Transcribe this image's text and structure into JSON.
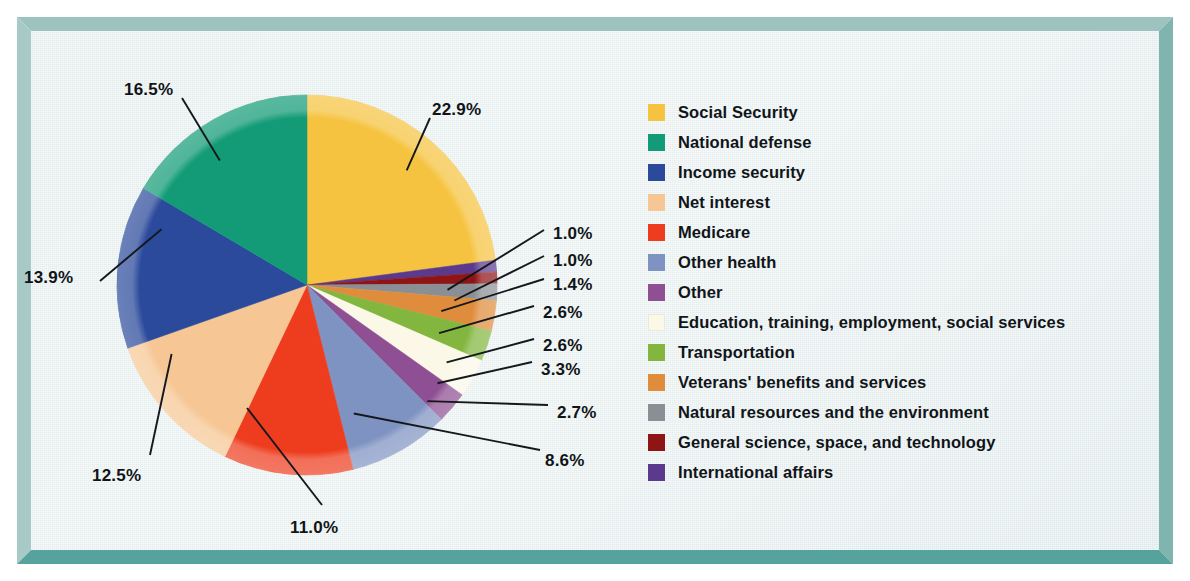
{
  "frame": {
    "border_color": "#7fb4af",
    "background_color": "#e9f1f1"
  },
  "chart_data": {
    "type": "pie",
    "title": "",
    "subtitle": "",
    "xlabel": "",
    "ylabel": "",
    "legend_position": "right",
    "grid": false,
    "units": "percent",
    "total": 100.0,
    "start_angle_deg": 0,
    "direction": "clockwise",
    "categories": [
      "Social Security",
      "International affairs",
      "General science, space, and technology",
      "Natural resources and the environment",
      "Veterans' benefits and services",
      "Transportation",
      "Education, training, employment, social services",
      "Other",
      "Other health",
      "Medicare",
      "Net interest",
      "Income security",
      "National defense"
    ],
    "values": [
      22.9,
      1.0,
      1.0,
      1.4,
      2.6,
      2.6,
      3.3,
      2.7,
      8.6,
      11.0,
      12.5,
      13.9,
      16.5
    ],
    "colors": [
      "#f5c council",
      "#5b3a8e",
      "#8f1414",
      "#8a8f96",
      "#df8c3c",
      "#82b63e",
      "#fbf8e8",
      "#8e4f93",
      "#7f93c2",
      "#ee3d1e",
      "#f6c794",
      "#2b4a9b",
      "#129b76"
    ],
    "slices": [
      {
        "label": "Social Security",
        "value": 22.9,
        "pct_text": "22.9%",
        "color": "#f5c33f"
      },
      {
        "label": "International affairs",
        "value": 1.0,
        "pct_text": "1.0%",
        "color": "#5b3a8e"
      },
      {
        "label": "General science, space, and technology",
        "value": 1.0,
        "pct_text": "1.0%",
        "color": "#8f1414"
      },
      {
        "label": "Natural resources and the environment",
        "value": 1.4,
        "pct_text": "1.4%",
        "color": "#8a8f96"
      },
      {
        "label": "Veterans' benefits and services",
        "value": 2.6,
        "pct_text": "2.6%",
        "color": "#df8c3c"
      },
      {
        "label": "Transportation",
        "value": 2.6,
        "pct_text": "2.6%",
        "color": "#82b63e"
      },
      {
        "label": "Education, training, employment, social services",
        "value": 3.3,
        "pct_text": "3.3%",
        "color": "#fbf8e8"
      },
      {
        "label": "Other",
        "value": 2.7,
        "pct_text": "2.7%",
        "color": "#8e4f93"
      },
      {
        "label": "Other health",
        "value": 8.6,
        "pct_text": "8.6%",
        "color": "#7f93c2"
      },
      {
        "label": "Medicare",
        "value": 11.0,
        "pct_text": "11.0%",
        "color": "#ee3d1e"
      },
      {
        "label": "Net interest",
        "value": 12.5,
        "pct_text": "12.5%",
        "color": "#f6c794"
      },
      {
        "label": "Income security",
        "value": 13.9,
        "pct_text": "13.9%",
        "color": "#2b4a9b"
      },
      {
        "label": "National defense",
        "value": 16.5,
        "pct_text": "16.5%",
        "color": "#129b76"
      }
    ]
  },
  "labels": [
    {
      "text": "22.9%",
      "x": 432,
      "y": 100
    },
    {
      "text": "16.5%",
      "x": 124,
      "y": 80
    },
    {
      "text": "13.9%",
      "x": 24,
      "y": 268
    },
    {
      "text": "12.5%",
      "x": 92,
      "y": 466
    },
    {
      "text": "11.0%",
      "x": 290,
      "y": 518
    },
    {
      "text": "8.6%",
      "x": 545,
      "y": 451
    },
    {
      "text": "2.7%",
      "x": 557,
      "y": 403
    },
    {
      "text": "3.3%",
      "x": 541,
      "y": 360
    },
    {
      "text": "2.6%",
      "x": 543,
      "y": 336
    },
    {
      "text": "2.6%",
      "x": 543,
      "y": 303
    },
    {
      "text": "1.4%",
      "x": 553,
      "y": 275
    },
    {
      "text": "1.0%",
      "x": 553,
      "y": 251
    },
    {
      "text": "1.0%",
      "x": 553,
      "y": 224
    }
  ],
  "legend": {
    "items": [
      {
        "label": "Social Security",
        "color": "#f5c33f"
      },
      {
        "label": "National defense",
        "color": "#129b76"
      },
      {
        "label": "Income security",
        "color": "#2b4a9b"
      },
      {
        "label": "Net interest",
        "color": "#f6c794"
      },
      {
        "label": "Medicare",
        "color": "#ee3d1e"
      },
      {
        "label": "Other health",
        "color": "#7f93c2"
      },
      {
        "label": "Other",
        "color": "#8e4f93"
      },
      {
        "label": "Education, training, employment, social services",
        "color": "#fbf8e8"
      },
      {
        "label": "Transportation",
        "color": "#82b63e"
      },
      {
        "label": "Veterans' benefits and services",
        "color": "#df8c3c"
      },
      {
        "label": "Natural resources and the environment",
        "color": "#8a8f96"
      },
      {
        "label": "General science, space, and technology",
        "color": "#8f1414"
      },
      {
        "label": "International affairs",
        "color": "#5b3a8e"
      }
    ]
  }
}
